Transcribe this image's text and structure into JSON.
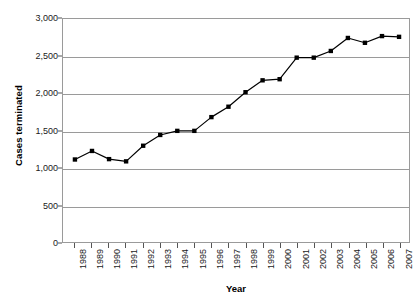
{
  "chart_data": {
    "type": "line",
    "title": "",
    "xlabel": "Year",
    "ylabel": "Cases terminated",
    "categories": [
      "1988",
      "1989",
      "1990",
      "1991",
      "1992",
      "1993",
      "1994",
      "1995",
      "1996",
      "1997",
      "1998",
      "1999",
      "2000",
      "2001",
      "2002",
      "2003",
      "2004",
      "2005",
      "2006",
      "2007"
    ],
    "values": [
      1110,
      1225,
      1115,
      1085,
      1295,
      1440,
      1495,
      1495,
      1680,
      1820,
      2015,
      2175,
      2190,
      2480,
      2480,
      2570,
      2745,
      2680,
      2770,
      2760
    ],
    "series": [
      {
        "name": "Cases terminated",
        "values": [
          1110,
          1225,
          1115,
          1085,
          1295,
          1440,
          1495,
          1495,
          1680,
          1820,
          2015,
          2175,
          2190,
          2480,
          2480,
          2570,
          2745,
          2680,
          2770,
          2760
        ]
      }
    ],
    "ylim": [
      0,
      3000
    ],
    "ytick_values": [
      0,
      500,
      1000,
      1500,
      2000,
      2500,
      3000
    ],
    "ytick_labels": [
      "0",
      "500",
      "1,000",
      "1,500",
      "2,000",
      "2,500",
      "3,000"
    ],
    "grid": true,
    "grid_axis": "y",
    "legend": false,
    "legend_position": "none",
    "marker": "square",
    "line_color": "#000000",
    "marker_color": "#000000",
    "grid_color": "#9a9a9a",
    "axis_color": "#9a9a9a",
    "background_color": "#ffffff"
  }
}
